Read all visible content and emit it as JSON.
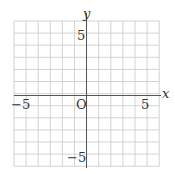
{
  "diagram": {
    "type": "coordinate-grid",
    "x_range": [
      -6,
      6
    ],
    "y_range": [
      -6,
      6
    ],
    "grid_step": 1,
    "axis_labels": {
      "x": "x",
      "y": "y"
    },
    "origin_label": "O",
    "tick_labels": {
      "x_neg": "−5",
      "x_pos": "5",
      "y_pos": "5",
      "y_neg": "−5"
    },
    "colors": {
      "grid": "#c8c8c8",
      "axis": "#555555",
      "text": "#333333"
    }
  }
}
